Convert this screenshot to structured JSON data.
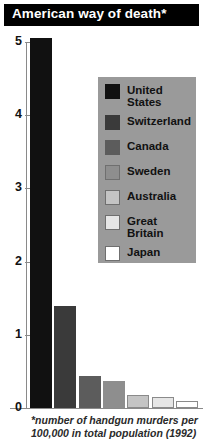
{
  "title": "American way of death*",
  "footnote_lines": [
    "*number of handgun murders per",
    "100,000 in total population (1992)"
  ],
  "legend": {
    "items": [
      {
        "label": "United\nStates",
        "color": "#111111"
      },
      {
        "label": "Switzerland",
        "color": "#3a3a3a"
      },
      {
        "label": "Canada",
        "color": "#5c5c5c"
      },
      {
        "label": "Sweden",
        "color": "#8e8e8e"
      },
      {
        "label": "Australia",
        "color": "#c4c4c4"
      },
      {
        "label": "Great\nBritain",
        "color": "#e6e6e6"
      },
      {
        "label": "Japan",
        "color": "#ffffff"
      }
    ]
  },
  "chart_data": {
    "type": "bar",
    "title": "American way of death*",
    "xlabel": "",
    "ylabel": "",
    "ylim": [
      0,
      5
    ],
    "yticks": [
      0,
      1,
      2,
      3,
      4,
      5
    ],
    "ytick_labels": [
      "0",
      "1",
      "2",
      "3",
      "4",
      "5"
    ],
    "grid": false,
    "legend_position": "inside-top-right",
    "note": "*number of handgun murders per 100,000 in total population (1992)",
    "categories": [
      "United States",
      "Switzerland",
      "Canada",
      "Sweden",
      "Australia",
      "Great Britain",
      "Japan"
    ],
    "values": [
      5.05,
      1.39,
      0.44,
      0.37,
      0.18,
      0.15,
      0.09
    ],
    "colors": [
      "#111111",
      "#3a3a3a",
      "#5c5c5c",
      "#8e8e8e",
      "#c4c4c4",
      "#e6e6e6",
      "#ffffff"
    ]
  }
}
